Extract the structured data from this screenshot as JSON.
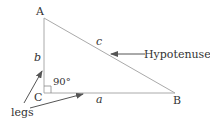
{
  "diagram": {
    "vertices": {
      "A": {
        "label": "A",
        "x": 44,
        "y": 18
      },
      "B": {
        "label": "B",
        "x": 175,
        "y": 93
      },
      "C": {
        "label": "C",
        "x": 44,
        "y": 93
      }
    },
    "sides": {
      "a": {
        "label": "a",
        "from": "C",
        "to": "B"
      },
      "b": {
        "label": "b",
        "from": "C",
        "to": "A"
      },
      "c": {
        "label": "c",
        "from": "A",
        "to": "B"
      }
    },
    "right_angle": {
      "label": "90°",
      "at": "C"
    },
    "annotations": {
      "hypotenuse": {
        "label": "Hypotenuse",
        "points_to": "c"
      },
      "legs": {
        "label": "legs",
        "points_to": [
          "a",
          "b"
        ]
      }
    },
    "colors": {
      "lines": "#aaaaaa",
      "text": "#333333",
      "arrows": "#555555"
    }
  }
}
